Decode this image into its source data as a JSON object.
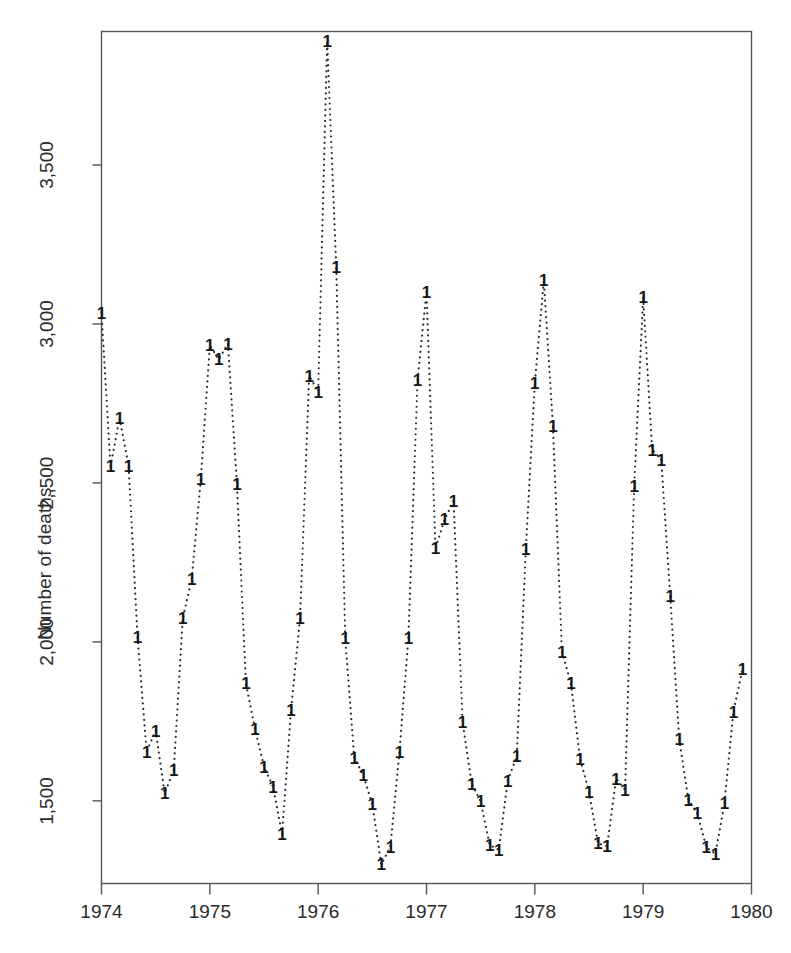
{
  "chart_data": {
    "type": "line",
    "title": "",
    "subtitle": "",
    "xlabel": "",
    "ylabel": "Number of deaths",
    "plot_symbol": "1",
    "line_style": "dotted",
    "grid": false,
    "legend": null,
    "xlim": [
      1974.0,
      1980.0
    ],
    "ylim": [
      1240,
      3920
    ],
    "xticks": [
      1974,
      1975,
      1976,
      1977,
      1978,
      1979,
      1980
    ],
    "xtick_labels": [
      "1974",
      "1975",
      "1976",
      "1977",
      "1978",
      "1979",
      "1980"
    ],
    "yticks": [
      1500,
      2000,
      2500,
      3000,
      3500
    ],
    "ytick_labels": [
      "1,500",
      "2,000",
      "2,,500",
      "3,000",
      "3,500"
    ],
    "x": [
      1974.0,
      1974.083,
      1974.167,
      1974.25,
      1974.333,
      1974.417,
      1974.5,
      1974.583,
      1974.667,
      1974.75,
      1974.833,
      1974.917,
      1975.0,
      1975.083,
      1975.167,
      1975.25,
      1975.333,
      1975.417,
      1975.5,
      1975.583,
      1975.667,
      1975.75,
      1975.833,
      1975.917,
      1976.0,
      1976.083,
      1976.167,
      1976.25,
      1976.333,
      1976.417,
      1976.5,
      1976.583,
      1976.667,
      1976.75,
      1976.833,
      1976.917,
      1977.0,
      1977.083,
      1977.167,
      1977.25,
      1977.333,
      1977.417,
      1977.5,
      1977.583,
      1977.667,
      1977.75,
      1977.833,
      1977.917,
      1978.0,
      1978.083,
      1978.167,
      1978.25,
      1978.333,
      1978.417,
      1978.5,
      1978.583,
      1978.667,
      1978.75,
      1978.833,
      1978.917,
      1979.0,
      1979.083,
      1979.167,
      1979.25,
      1979.333,
      1979.417,
      1979.5,
      1979.583,
      1979.667,
      1979.75,
      1979.833,
      1979.917
    ],
    "values": [
      3035,
      2552,
      2704,
      2554,
      2014,
      1655,
      1721,
      1524,
      1596,
      2074,
      2199,
      2512,
      2933,
      2889,
      2938,
      2497,
      1870,
      1726,
      1607,
      1545,
      1396,
      1787,
      2076,
      2837,
      2787,
      3891,
      3179,
      2011,
      1636,
      1580,
      1489,
      1300,
      1356,
      1653,
      2013,
      2823,
      3102,
      2294,
      2385,
      2444,
      1748,
      1554,
      1498,
      1361,
      1346,
      1564,
      1640,
      2293,
      2815,
      3137,
      2679,
      1969,
      1870,
      1633,
      1529,
      1366,
      1357,
      1570,
      1535,
      2491,
      3084,
      2605,
      2573,
      2143,
      1693,
      1504,
      1461,
      1354,
      1333,
      1492,
      1781,
      1915
    ],
    "series_name": "1",
    "n_points": 72,
    "data_min": 1300,
    "data_max": 3891,
    "period": "monthly"
  },
  "axis": {
    "y_title": "Number of deaths",
    "frame_color": "#555555"
  }
}
